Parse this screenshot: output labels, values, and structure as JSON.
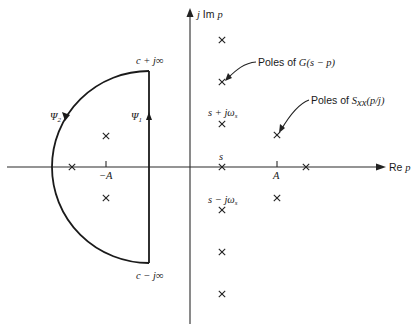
{
  "figure": {
    "axes": {
      "vertical_label": "j Im p",
      "horizontal_label": "Re p"
    },
    "contour": {
      "top_label": "c + j∞",
      "bottom_label": "c − j∞",
      "psi1_label": "Ψ",
      "psi1_sub": "1",
      "psi2_label": "Ψ",
      "psi2_sub": "2"
    },
    "tick_labels": {
      "neg_A": "−A",
      "pos_A": "A",
      "s": "s"
    },
    "point_labels": {
      "s_plus": "s + jω",
      "s_plus_sub": "s",
      "s_minus": "s − jω",
      "s_minus_sub": "s"
    },
    "annotations": {
      "poles_G_prefix": "Poles of ",
      "poles_G_math": "G(s − p)",
      "poles_S_prefix": "Poles of ",
      "poles_S_math": "S",
      "poles_S_sub": "xx",
      "poles_S_tail": "(p/j)"
    },
    "poles": {
      "G_column": [
        {
          "x": 222,
          "y": 40
        },
        {
          "x": 222,
          "y": 82
        },
        {
          "x": 222,
          "y": 124
        },
        {
          "x": 222,
          "y": 167
        },
        {
          "x": 222,
          "y": 210
        },
        {
          "x": 222,
          "y": 252
        },
        {
          "x": 222,
          "y": 294
        }
      ],
      "S_right": [
        {
          "x": 277,
          "y": 135
        },
        {
          "x": 306,
          "y": 167
        },
        {
          "x": 277,
          "y": 198
        }
      ],
      "S_left": [
        {
          "x": 106,
          "y": 136
        },
        {
          "x": 72,
          "y": 167
        },
        {
          "x": 106,
          "y": 198
        }
      ]
    }
  }
}
